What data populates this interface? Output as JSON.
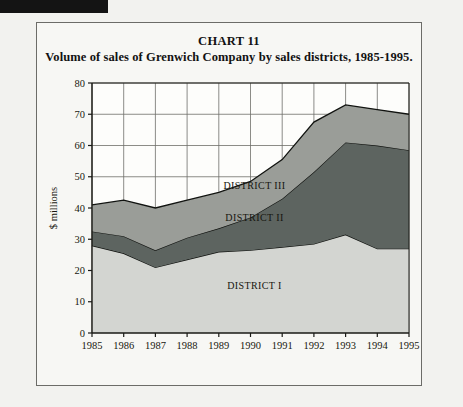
{
  "scan_artifact": {
    "name": "black-margin-bar"
  },
  "header": {
    "chart_number": "CHART 11",
    "caption": "Volume of sales of Grenwich Company by sales districts, 1985-1995."
  },
  "chart_data": {
    "type": "area",
    "stacked": true,
    "title": "Volume of sales of Grenwich Company by sales districts, 1985-1995.",
    "subtitle": "CHART 11",
    "xlabel": "",
    "ylabel": "$ millions",
    "ylim": [
      0,
      80
    ],
    "xlim": [
      "1985",
      "1995"
    ],
    "yticks": [
      0,
      10,
      20,
      30,
      40,
      50,
      60,
      70,
      80
    ],
    "grid": true,
    "legend": "inline-labels",
    "categories": [
      "1985",
      "1986",
      "1987",
      "1988",
      "1989",
      "1990",
      "1991",
      "1992",
      "1993",
      "1994",
      "1995"
    ],
    "series": [
      {
        "name": "DISTRICT I",
        "color": "#d3d5d1",
        "values": [
          28,
          25.5,
          21,
          23.5,
          26,
          26.5,
          27.5,
          28.5,
          31.5,
          27,
          27
        ]
      },
      {
        "name": "DISTRICT II",
        "color": "#5d6460",
        "values": [
          4.5,
          5.5,
          5.5,
          7,
          7.5,
          10.5,
          15.5,
          23,
          29.5,
          33,
          31.5
        ]
      },
      {
        "name": "DISTRICT III",
        "color": "#9a9d98",
        "values": [
          8.5,
          11.5,
          13.5,
          12,
          11.5,
          11.5,
          12.5,
          16,
          12,
          11.5,
          11.5
        ]
      }
    ],
    "totals": [
      41,
      42.5,
      40,
      42.5,
      45,
      48.5,
      55.5,
      67.5,
      73,
      71.5,
      70
    ],
    "annotations": [
      {
        "text": "DISTRICT III",
        "x": "1990",
        "y": 46
      },
      {
        "text": "DISTRICT II",
        "x": "1990",
        "y": 36
      },
      {
        "text": "DISTRICT I",
        "x": "1990",
        "y": 14
      }
    ]
  },
  "colors": {
    "district_1": "#d3d5d1",
    "district_2": "#5d6460",
    "district_3": "#9a9d98",
    "frame": "#6c6c68",
    "axis": "#1a1a16",
    "grid": "#6e6e6a",
    "page_bg": "#f2f2ef",
    "panel_bg": "#f7f7f4"
  }
}
